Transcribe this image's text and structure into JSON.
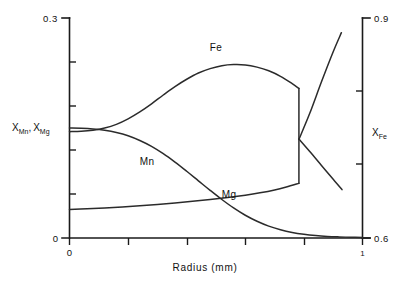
{
  "chart_data": {
    "type": "line",
    "title": "",
    "xlabel": "Radius (mm)",
    "ylabel_left": "X_Mn , X_Mg",
    "ylabel_right": "X_Fe",
    "xlim": [
      0,
      1
    ],
    "xticklabels": [
      "0",
      "1"
    ],
    "x_tick_count_interior": 4,
    "ylim_left": [
      0,
      0.3
    ],
    "yticklabels_left": [
      "0",
      "0.3"
    ],
    "y_left_tick_count_interior": 4,
    "ylim_right": [
      0.6,
      0.9
    ],
    "yticklabels_right": [
      "0.6",
      "0.9"
    ],
    "y_right_tick_count_interior": 2,
    "grid": false,
    "legend": "inline-curve-labels",
    "series": [
      {
        "name": "Fe",
        "label": "Fe",
        "axis": "right",
        "label_x": 0.5,
        "label_y": 0.855,
        "discontinuity_x": 0.783,
        "points": [
          [
            0.0,
            0.745
          ],
          [
            0.04,
            0.7455
          ],
          [
            0.08,
            0.747
          ],
          [
            0.12,
            0.75
          ],
          [
            0.16,
            0.755
          ],
          [
            0.2,
            0.7625
          ],
          [
            0.24,
            0.772
          ],
          [
            0.28,
            0.783
          ],
          [
            0.32,
            0.795
          ],
          [
            0.36,
            0.8065
          ],
          [
            0.4,
            0.8165
          ],
          [
            0.44,
            0.825
          ],
          [
            0.48,
            0.831
          ],
          [
            0.52,
            0.835
          ],
          [
            0.56,
            0.8365
          ],
          [
            0.6,
            0.836
          ],
          [
            0.64,
            0.833
          ],
          [
            0.68,
            0.828
          ],
          [
            0.72,
            0.8205
          ],
          [
            0.76,
            0.8105
          ],
          [
            0.783,
            0.804
          ]
        ],
        "points_after_drop": [
          [
            0.783,
            0.735
          ],
          [
            0.82,
            0.718
          ],
          [
            0.86,
            0.699
          ],
          [
            0.9,
            0.68
          ],
          [
            0.93,
            0.666
          ]
        ]
      },
      {
        "name": "Mn",
        "label": "Mn",
        "axis": "left",
        "label_x": 0.265,
        "label_y": 0.1,
        "points": [
          [
            0.0,
            0.15
          ],
          [
            0.04,
            0.1497
          ],
          [
            0.08,
            0.1488
          ],
          [
            0.12,
            0.147
          ],
          [
            0.16,
            0.144
          ],
          [
            0.2,
            0.1395
          ],
          [
            0.24,
            0.133
          ],
          [
            0.28,
            0.125
          ],
          [
            0.32,
            0.115
          ],
          [
            0.36,
            0.1035
          ],
          [
            0.4,
            0.091
          ],
          [
            0.44,
            0.078
          ],
          [
            0.48,
            0.065
          ],
          [
            0.52,
            0.0525
          ],
          [
            0.56,
            0.041
          ],
          [
            0.6,
            0.031
          ],
          [
            0.64,
            0.0228
          ],
          [
            0.68,
            0.0162
          ],
          [
            0.72,
            0.0112
          ],
          [
            0.76,
            0.0075
          ],
          [
            0.8,
            0.005
          ],
          [
            0.84,
            0.0033
          ],
          [
            0.88,
            0.0022
          ],
          [
            0.92,
            0.0015
          ],
          [
            0.96,
            0.001
          ],
          [
            1.0,
            0.0008
          ]
        ]
      },
      {
        "name": "Mg",
        "label": "Mg",
        "axis": "left",
        "label_x": 0.545,
        "label_y": 0.0545,
        "discontinuity_x": 0.783,
        "points": [
          [
            0.0,
            0.039
          ],
          [
            0.06,
            0.0398
          ],
          [
            0.12,
            0.041
          ],
          [
            0.18,
            0.0424
          ],
          [
            0.24,
            0.044
          ],
          [
            0.3,
            0.0458
          ],
          [
            0.36,
            0.0478
          ],
          [
            0.42,
            0.05
          ],
          [
            0.48,
            0.0524
          ],
          [
            0.54,
            0.0552
          ],
          [
            0.6,
            0.0584
          ],
          [
            0.65,
            0.0616
          ],
          [
            0.7,
            0.0655
          ],
          [
            0.74,
            0.0695
          ],
          [
            0.783,
            0.0745
          ]
        ],
        "points_after_jump": [
          [
            0.783,
            0.1345
          ],
          [
            0.82,
            0.17
          ],
          [
            0.86,
            0.213
          ],
          [
            0.9,
            0.254
          ],
          [
            0.928,
            0.28
          ]
        ]
      }
    ]
  },
  "axes": {
    "left": {
      "top_label": "0.3",
      "bottom_label": "0",
      "title_main": "X",
      "title_sub1": "Mn",
      "title_comma": ",",
      "title_main2": "X",
      "title_sub2": "Mg"
    },
    "right": {
      "top_label": "0.9",
      "bottom_label": "0.6",
      "title_main": "X",
      "title_sub": "Fe"
    },
    "bottom": {
      "left_label": "0",
      "right_label": "1",
      "title": "Radius (mm)"
    }
  },
  "curve_labels": {
    "fe": "Fe",
    "mn": "Mn",
    "mg": "Mg"
  },
  "colors": {
    "axis": "#1a1a1a",
    "curve": "#2b2b2b",
    "background": "#ffffff"
  }
}
